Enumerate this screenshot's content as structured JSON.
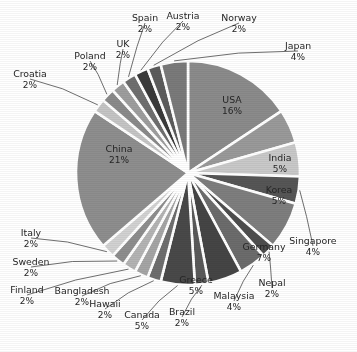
{
  "chart_data": {
    "type": "pie",
    "title": "",
    "subtitle": "",
    "xlabel": "",
    "ylabel": "",
    "legend_position": "none",
    "grid": false,
    "units": "percent",
    "total": 100,
    "start_angle_deg": -90,
    "direction": "clockwise",
    "categories": [
      "USA",
      "India",
      "Korea",
      "Singapore",
      "Germany",
      "Nepal",
      "Malaysia",
      "Greece",
      "Brazil",
      "Canada",
      "Hawaii",
      "Bangladesh",
      "Finland",
      "Sweden",
      "Italy",
      "China",
      "Croatia",
      "Poland",
      "UK",
      "Spain",
      "Austria",
      "Norway",
      "Japan"
    ],
    "values": [
      16,
      5,
      5,
      4,
      7,
      2,
      4,
      5,
      2,
      5,
      2,
      2,
      2,
      2,
      2,
      21,
      2,
      2,
      2,
      2,
      2,
      2,
      4
    ],
    "slices": [
      {
        "label": "USA",
        "pct": "16%",
        "value": 16,
        "color": "#8b8b8b",
        "label_placement": "inside",
        "label_color": "#1a1a1a",
        "lx": 232,
        "ly": 100
      },
      {
        "label": "India",
        "pct": "5%",
        "value": 5,
        "color": "#9a9a9a",
        "label_placement": "inside",
        "label_color": "#1a1a1a",
        "lx": 280,
        "ly": 158
      },
      {
        "label": "Korea",
        "pct": "5%",
        "value": 5,
        "color": "#c9c9c9",
        "label_placement": "inside",
        "label_color": "#1a1a1a",
        "lx": 279,
        "ly": 190
      },
      {
        "label": "Singapore",
        "pct": "4%",
        "value": 4,
        "color": "#565656",
        "label_placement": "outside",
        "label_color": "#262626",
        "lx": 313,
        "ly": 241
      },
      {
        "label": "Germany",
        "pct": "7%",
        "value": 7,
        "color": "#7e7e7e",
        "label_placement": "inside",
        "label_color": "#1a1a1a",
        "lx": 264,
        "ly": 247
      },
      {
        "label": "Nepal",
        "pct": "2%",
        "value": 2,
        "color": "#4e4e4e",
        "label_placement": "outside",
        "label_color": "#262626",
        "lx": 272,
        "ly": 283
      },
      {
        "label": "Malaysia",
        "pct": "4%",
        "value": 4,
        "color": "#6c6c6c",
        "label_placement": "outside",
        "label_color": "#262626",
        "lx": 234,
        "ly": 296
      },
      {
        "label": "Greece",
        "pct": "5%",
        "value": 5,
        "color": "#454545",
        "label_placement": "inside",
        "label_color": "#f2f2f2",
        "lx": 196,
        "ly": 280
      },
      {
        "label": "Brazil",
        "pct": "2%",
        "value": 2,
        "color": "#5a5a5a",
        "label_placement": "outside",
        "label_color": "#262626",
        "lx": 182,
        "ly": 312
      },
      {
        "label": "Canada",
        "pct": "5%",
        "value": 5,
        "color": "#494949",
        "label_placement": "outside",
        "label_color": "#262626",
        "lx": 142,
        "ly": 315
      },
      {
        "label": "Hawaii",
        "pct": "2%",
        "value": 2,
        "color": "#6e6e6e",
        "label_placement": "outside",
        "label_color": "#262626",
        "lx": 105,
        "ly": 304
      },
      {
        "label": "Bangladesh",
        "pct": "2%",
        "value": 2,
        "color": "#a5a5a5",
        "label_placement": "outside",
        "label_color": "#262626",
        "lx": 82,
        "ly": 291
      },
      {
        "label": "Finland",
        "pct": "2%",
        "value": 2,
        "color": "#b4b4b4",
        "label_placement": "outside",
        "label_color": "#262626",
        "lx": 27,
        "ly": 290
      },
      {
        "label": "Sweden",
        "pct": "2%",
        "value": 2,
        "color": "#8e8e8e",
        "label_placement": "outside",
        "label_color": "#262626",
        "lx": 31,
        "ly": 262
      },
      {
        "label": "Italy",
        "pct": "2%",
        "value": 2,
        "color": "#d2d2d2",
        "label_placement": "outside",
        "label_color": "#262626",
        "lx": 31,
        "ly": 233
      },
      {
        "label": "China",
        "pct": "21%",
        "value": 21,
        "color": "#8e8e8e",
        "label_placement": "inside",
        "label_color": "#1a1a1a",
        "lx": 119,
        "ly": 149
      },
      {
        "label": "Croatia",
        "pct": "2%",
        "value": 2,
        "color": "#c5c5c5",
        "label_placement": "outside",
        "label_color": "#262626",
        "lx": 30,
        "ly": 74
      },
      {
        "label": "Poland",
        "pct": "2%",
        "value": 2,
        "color": "#8a8a8a",
        "label_placement": "outside",
        "label_color": "#262626",
        "lx": 90,
        "ly": 56
      },
      {
        "label": "UK",
        "pct": "2%",
        "value": 2,
        "color": "#9e9e9e",
        "label_placement": "outside",
        "label_color": "#262626",
        "lx": 123,
        "ly": 44
      },
      {
        "label": "Spain",
        "pct": "2%",
        "value": 2,
        "color": "#6f6f6f",
        "label_placement": "outside",
        "label_color": "#262626",
        "lx": 145,
        "ly": 18
      },
      {
        "label": "Austria",
        "pct": "2%",
        "value": 2,
        "color": "#3a3a3a",
        "label_placement": "outside",
        "label_color": "#262626",
        "lx": 183,
        "ly": 16
      },
      {
        "label": "Norway",
        "pct": "2%",
        "value": 2,
        "color": "#5c5c5c",
        "label_placement": "outside",
        "label_color": "#262626",
        "lx": 239,
        "ly": 18
      },
      {
        "label": "Japan",
        "pct": "4%",
        "value": 4,
        "color": "#7a7a7a",
        "label_placement": "outside",
        "label_color": "#262626",
        "lx": 298,
        "ly": 46
      }
    ],
    "geometry": {
      "cx": 188,
      "cy": 173,
      "r": 112
    },
    "colors": {
      "background": "#ffffff",
      "separator": "#ffffff",
      "text": "#262626",
      "leader": "#4a4a4a"
    }
  }
}
